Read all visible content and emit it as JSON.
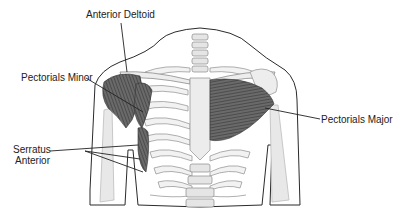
{
  "diagram": {
    "labels": [
      {
        "id": "anterior-deltoid",
        "text": "Anterior Deltoid"
      },
      {
        "id": "pectorals-minor",
        "text": "Pectorials Minor"
      },
      {
        "id": "pectorals-major",
        "text": "Pectorials Major"
      },
      {
        "id": "serratus-anterior-1",
        "text": "Serratus"
      },
      {
        "id": "serratus-anterior-2",
        "text": "Anterior"
      }
    ]
  },
  "colors": {
    "outline": "#2a2a2a",
    "muscle": "#555555",
    "bone": "#e8e8e8",
    "bone_stroke": "#9a9a9a",
    "label": "#222222",
    "background": "#ffffff"
  }
}
